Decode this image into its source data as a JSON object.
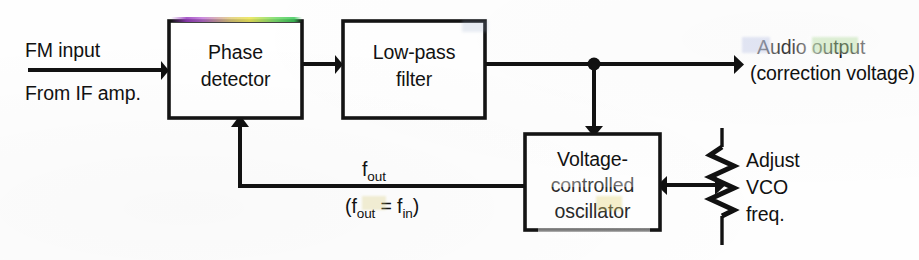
{
  "diagram": {
    "type": "block-diagram",
    "blocks": [
      {
        "id": "phase-detector",
        "label_line1": "Phase",
        "label_line2": "detector",
        "x": 169,
        "y": 21,
        "w": 133,
        "h": 97
      },
      {
        "id": "low-pass-filter",
        "label_line1": "Low-pass",
        "label_line2": "filter",
        "x": 343,
        "y": 21,
        "w": 142,
        "h": 97
      },
      {
        "id": "vco",
        "label_line1": "Voltage-",
        "label_line2": "controlled",
        "label_line3": "oscillator",
        "x": 525,
        "y": 134,
        "w": 135,
        "h": 96
      }
    ],
    "labels": {
      "fm_input": "FM input",
      "from_if_amp": "From IF amp.",
      "audio_output": "Audio output",
      "correction_voltage": "(correction voltage)",
      "f_out_main": "f",
      "f_out_sub": "out",
      "f_relation_open": "(f",
      "f_relation_sub1": "out",
      "f_relation_eq": " = f",
      "f_relation_sub2": "in",
      "f_relation_close": ")",
      "adjust": "Adjust",
      "vco_short": "VCO",
      "freq": "freq."
    },
    "components": [
      {
        "id": "potentiometer",
        "kind": "variable-resistor",
        "label": "Adjust VCO freq."
      },
      {
        "id": "junction-dot",
        "kind": "wire-junction",
        "x": 594,
        "y": 64
      }
    ],
    "colors": {
      "ink": "#121212",
      "paper": "#fefefe",
      "fringe_violet": "#963cbe",
      "fringe_yellow": "#ebe65a",
      "fringe_green": "#3cc85a"
    }
  }
}
